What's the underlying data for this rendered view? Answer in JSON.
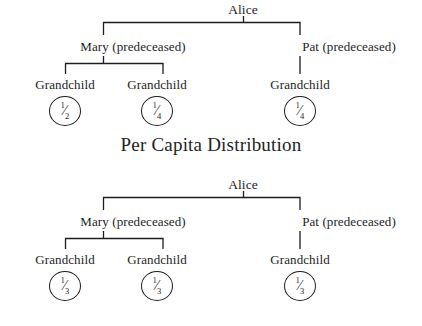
{
  "page": {
    "background_color": "#ffffff",
    "text_color": "#232323",
    "line_color": "#1d1d1d"
  },
  "titles": {
    "per_capita": "Per Capita Distribution"
  },
  "diagrams": [
    {
      "id": "per-capita",
      "name": "per-capita-distribution-tree",
      "root": {
        "label": "Alice"
      },
      "children": [
        {
          "label": "Mary (predeceased)"
        },
        {
          "label": "Pat (predeceased)"
        }
      ],
      "grandchildren": [
        {
          "label": "Grandchild",
          "share": {
            "numerator": "1",
            "solidus": "⁄",
            "denominator": "2"
          }
        },
        {
          "label": "Grandchild",
          "share": {
            "numerator": "1",
            "solidus": "⁄",
            "denominator": "4"
          }
        },
        {
          "label": "Grandchild",
          "share": {
            "numerator": "1",
            "solidus": "⁄",
            "denominator": "4"
          }
        }
      ]
    },
    {
      "id": "per-stirpes",
      "name": "equal-share-distribution-tree",
      "root": {
        "label": "Alice"
      },
      "children": [
        {
          "label": "Mary (predeceased)"
        },
        {
          "label": "Pat (predeceased)"
        }
      ],
      "grandchildren": [
        {
          "label": "Grandchild",
          "share": {
            "numerator": "1",
            "solidus": "⁄",
            "denominator": "3"
          }
        },
        {
          "label": "Grandchild",
          "share": {
            "numerator": "1",
            "solidus": "⁄",
            "denominator": "3"
          }
        },
        {
          "label": "Grandchild",
          "share": {
            "numerator": "1",
            "solidus": "⁄",
            "denominator": "3"
          }
        }
      ]
    }
  ]
}
